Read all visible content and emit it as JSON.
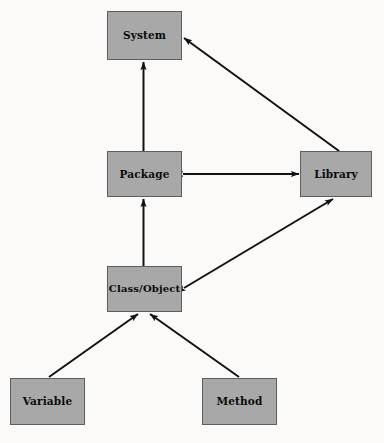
{
  "diagram": {
    "type": "block-diagram",
    "background_color": "#fbfaf8",
    "node_fill_color": "#a8a8a8",
    "node_border_color": "#5d5d5d",
    "edge_color": "#111111",
    "nodes": [
      {
        "id": "system",
        "label": "System",
        "x": 107,
        "y": 11,
        "w": 75,
        "h": 49
      },
      {
        "id": "package",
        "label": "Package",
        "x": 107,
        "y": 151,
        "w": 75,
        "h": 46
      },
      {
        "id": "library",
        "label": "Library",
        "x": 300,
        "y": 151,
        "w": 72,
        "h": 46
      },
      {
        "id": "classobject",
        "label": "Class/Object",
        "x": 107,
        "y": 266,
        "w": 75,
        "h": 46
      },
      {
        "id": "variable",
        "label": "Variable",
        "x": 10,
        "y": 378,
        "w": 75,
        "h": 47
      },
      {
        "id": "method",
        "label": "Method",
        "x": 202,
        "y": 378,
        "w": 75,
        "h": 47
      }
    ],
    "edges": [
      {
        "id": "package-to-system",
        "from": "package",
        "to": "system",
        "direction": "one-way"
      },
      {
        "id": "library-to-system",
        "from": "library",
        "to": "system",
        "direction": "one-way"
      },
      {
        "id": "package-library",
        "from": "package",
        "to": "library",
        "direction": "two-way"
      },
      {
        "id": "classobject-to-package",
        "from": "classobject",
        "to": "package",
        "direction": "one-way"
      },
      {
        "id": "classobject-library",
        "from": "classobject",
        "to": "library",
        "direction": "two-way"
      },
      {
        "id": "variable-to-classobject",
        "from": "variable",
        "to": "classobject",
        "direction": "one-way"
      },
      {
        "id": "method-to-classobject",
        "from": "method",
        "to": "classobject",
        "direction": "one-way"
      }
    ]
  }
}
